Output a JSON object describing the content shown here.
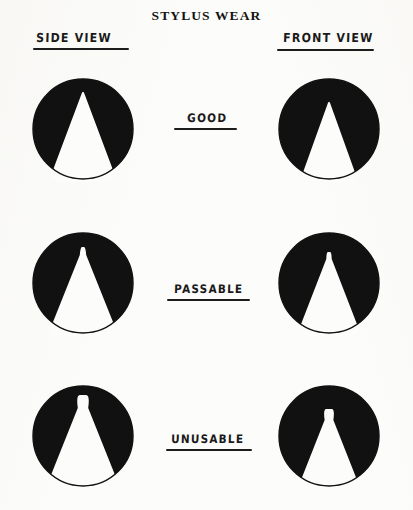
{
  "document": {
    "title": "STYLUS WEAR",
    "background_color": "#fcfcfa",
    "ink_color": "#1a1a1a"
  },
  "columns": [
    {
      "id": "side-view",
      "label": "SIDE VIEW"
    },
    {
      "id": "front-view",
      "label": "FRONT VIEW"
    }
  ],
  "grades": [
    {
      "id": "good",
      "label": "GOOD"
    },
    {
      "id": "passable",
      "label": "PASSABLE"
    },
    {
      "id": "unusable",
      "label": "UNUSABLE"
    }
  ],
  "figures": [
    {
      "id": "side-good",
      "row": "good",
      "column": "side-view",
      "description": "black circular disc with white conical stylus tip, sharp narrow apex",
      "tip_half_width_at_base": 33,
      "tip_apex_y": 14,
      "tip_apex_radius": 5,
      "wear_flat_width": 0
    },
    {
      "id": "front-good",
      "row": "good",
      "column": "front-view",
      "description": "black circular disc with white conical stylus tip, sharp narrow apex",
      "tip_half_width_at_base": 28,
      "tip_apex_y": 24,
      "tip_apex_radius": 5,
      "wear_flat_width": 0
    },
    {
      "id": "side-passable",
      "row": "passable",
      "column": "side-view",
      "description": "black circular disc with white conical stylus tip, slightly blunted apex",
      "tip_half_width_at_base": 34,
      "tip_apex_y": 17,
      "tip_apex_radius": 8,
      "wear_flat_width": 5
    },
    {
      "id": "front-passable",
      "row": "passable",
      "column": "front-view",
      "description": "black circular disc with white conical stylus tip, slightly blunted apex",
      "tip_half_width_at_base": 31,
      "tip_apex_y": 22,
      "tip_apex_radius": 7,
      "wear_flat_width": 5
    },
    {
      "id": "side-unusable",
      "row": "unusable",
      "column": "side-view",
      "description": "black circular disc with white conical stylus tip, heavily worn rounded flat apex",
      "tip_half_width_at_base": 36,
      "tip_apex_y": 12,
      "tip_apex_radius": 13,
      "wear_flat_width": 14
    },
    {
      "id": "front-unusable",
      "row": "unusable",
      "column": "front-view",
      "description": "black circular disc with white conical stylus tip, heavily worn rounded flat apex",
      "tip_half_width_at_base": 30,
      "tip_apex_y": 26,
      "tip_apex_radius": 11,
      "wear_flat_width": 12
    }
  ]
}
